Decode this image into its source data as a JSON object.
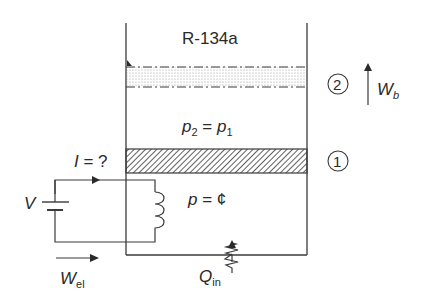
{
  "diagram": {
    "substance_label": "R-134a",
    "state_2_marker": "2",
    "state_1_marker": "1",
    "boundary_work": {
      "symbol": "W",
      "subscript": "b"
    },
    "pressure_relation": {
      "lhs": "p",
      "lhs_sub": "2",
      "eq": " = ",
      "rhs": "p",
      "rhs_sub": "1"
    },
    "constant_pressure": {
      "symbol": "p",
      "eq": " = ",
      "value": "¢"
    },
    "current_label": {
      "symbol": "I",
      "rest": " = ?"
    },
    "voltage_label": "V",
    "electrical_work": {
      "symbol": "W",
      "subscript": "el"
    },
    "heat_in": {
      "symbol": "Q",
      "subscript": "in"
    },
    "colors": {
      "line": "#3a3a3a",
      "piston_hatch": "#3a3a3a",
      "stipple": "#9a9a9a",
      "text": "#2a2a2a"
    }
  }
}
